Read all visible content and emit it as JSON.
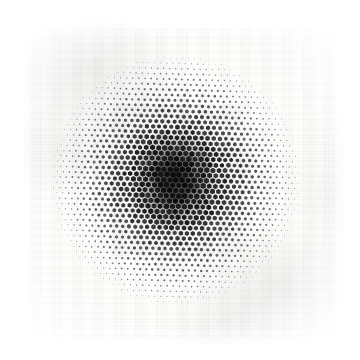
{
  "image": {
    "title": "Halftone Dot Gradient Swatch",
    "subject": "radial halftone dot pattern printed on white woven fabric",
    "medium": "printed textile swatch photograph",
    "canvas_width": 360,
    "canvas_height": 360,
    "background_color": "#ffffff"
  },
  "substrate": {
    "name": "fabric-swatch",
    "shape": "square",
    "left": 30,
    "top": 28,
    "width": 308,
    "height": 310,
    "base_color": "#fdfdfc",
    "edge": "soft frayed",
    "texture": "fine woven thread grid",
    "shadow_color": "#e9e9e8",
    "wrinkle_regions": [
      "upper-left",
      "left-middle",
      "lower-right",
      "bottom-center"
    ]
  },
  "chart_data": {
    "type": "heatmap",
    "title": "Radial halftone dot gradient",
    "xlabel": "",
    "ylabel": "",
    "grid": "hexagonal",
    "dot_shape": "hexagon",
    "dot_spacing_px": 6.1,
    "row_pitch_px": 5.3,
    "grid_rotation_deg": 1.5,
    "ink_color": "#1a1a1a",
    "paper_color": "#fdfdfc",
    "center_x": 176,
    "center_y": 180,
    "max_radius_px": 126,
    "max_dot_radius_px": 3.0,
    "min_dot_radius_px": 0.22,
    "falloff": "gaussian-ish, full coverage to r=34 then smooth decay to zero at r=126",
    "coverage_profile": {
      "radius_px": [
        0,
        10,
        20,
        30,
        40,
        50,
        60,
        70,
        80,
        90,
        100,
        110,
        120,
        126
      ],
      "ink_coverage_pct": [
        100,
        100,
        98,
        94,
        86,
        75,
        62,
        49,
        36,
        25,
        15,
        7,
        2,
        0
      ]
    },
    "annotations": []
  },
  "accessibility": {
    "alt_text": "A square of white woven fabric printed with a circular halftone pattern: tiny hexagonal dots grow from almost invisible at the rim to a solid dark mass at the center."
  }
}
